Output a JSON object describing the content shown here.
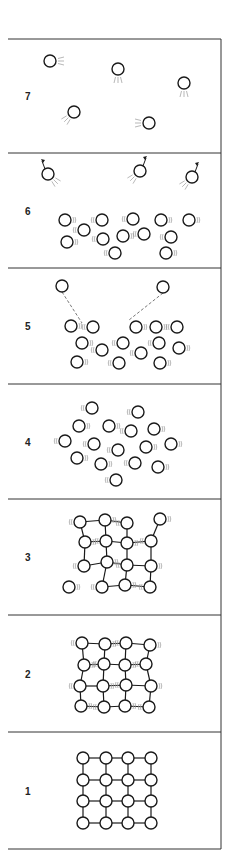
{
  "diagram": {
    "colors": {
      "line": "#1a1a1a",
      "vibration": "#9a9a9a",
      "frame": "#333333",
      "background": "#ffffff"
    },
    "panels": [
      {
        "label": "7",
        "state": "gas",
        "top": 39,
        "bottom": 153,
        "particles": [
          [
            50,
            61,
            "r"
          ],
          [
            118,
            69,
            "b"
          ],
          [
            184,
            83,
            "b"
          ],
          [
            74,
            112,
            "bl"
          ],
          [
            149,
            123,
            "l"
          ]
        ]
      },
      {
        "label": "6",
        "state": "liquid-evaporating",
        "top": 153,
        "bottom": 268,
        "escaping": [
          [
            48,
            174,
            -1
          ],
          [
            140,
            171,
            1
          ],
          [
            192,
            177,
            1
          ]
        ],
        "particles": [
          [
            65,
            220
          ],
          [
            84,
            230
          ],
          [
            102,
            220
          ],
          [
            133,
            219
          ],
          [
            161,
            220
          ],
          [
            189,
            220
          ],
          [
            67,
            242
          ],
          [
            103,
            239
          ],
          [
            123,
            236
          ],
          [
            144,
            234
          ],
          [
            171,
            237
          ],
          [
            115,
            253
          ],
          [
            166,
            253
          ]
        ]
      },
      {
        "label": "5",
        "state": "liquid",
        "top": 268,
        "bottom": 384,
        "escaping": [
          [
            62,
            286,
            82,
            323
          ],
          [
            163,
            287,
            129,
            320
          ]
        ],
        "particles": [
          [
            71,
            326
          ],
          [
            93,
            327
          ],
          [
            136,
            327
          ],
          [
            156,
            327
          ],
          [
            177,
            327
          ],
          [
            82,
            343
          ],
          [
            102,
            350
          ],
          [
            123,
            343
          ],
          [
            159,
            343
          ],
          [
            179,
            348
          ],
          [
            141,
            353
          ],
          [
            77,
            362
          ],
          [
            119,
            363
          ],
          [
            160,
            363
          ]
        ]
      },
      {
        "label": "4",
        "state": "liquid-melted",
        "top": 384,
        "bottom": 499,
        "particles": [
          [
            92,
            408
          ],
          [
            138,
            412
          ],
          [
            79,
            426
          ],
          [
            109,
            426
          ],
          [
            131,
            431
          ],
          [
            154,
            429
          ],
          [
            65,
            441
          ],
          [
            94,
            444
          ],
          [
            118,
            450
          ],
          [
            146,
            447
          ],
          [
            171,
            444
          ],
          [
            77,
            458
          ],
          [
            101,
            464
          ],
          [
            135,
            463
          ],
          [
            158,
            467
          ],
          [
            116,
            480
          ]
        ]
      },
      {
        "label": "3",
        "state": "solid-melting",
        "top": 499,
        "bottom": 615,
        "grid": [
          [
            [
              80,
              522
            ],
            [
              105,
              520
            ],
            [
              127,
              523
            ],
            [
              160,
              519
            ]
          ],
          [
            [
              85,
              542
            ],
            [
              106,
              541
            ],
            [
              127,
              543
            ],
            [
              151,
              541
            ]
          ],
          [
            [
              84,
              566
            ],
            [
              107,
              562
            ],
            [
              127,
              565
            ],
            [
              151,
              566
            ]
          ],
          [
            [
              69,
              587
            ],
            [
              102,
              587
            ],
            [
              125,
              585
            ],
            [
              150,
              587
            ]
          ]
        ]
      },
      {
        "label": "2",
        "state": "solid-vibrating",
        "top": 615,
        "bottom": 732,
        "grid": [
          [
            [
              82,
              643
            ],
            [
              105,
              644
            ],
            [
              126,
              643
            ],
            [
              150,
              645
            ]
          ],
          [
            [
              84,
              665
            ],
            [
              104,
              664
            ],
            [
              125,
              665
            ],
            [
              146,
              664
            ]
          ],
          [
            [
              80,
              686
            ],
            [
              103,
              686
            ],
            [
              126,
              685
            ],
            [
              151,
              686
            ]
          ],
          [
            [
              81,
              706
            ],
            [
              104,
              707
            ],
            [
              125,
              706
            ],
            [
              149,
              707
            ]
          ]
        ]
      },
      {
        "label": "1",
        "state": "solid",
        "top": 732,
        "bottom": 849,
        "grid": [
          [
            [
              83,
              758
            ],
            [
              106,
              758
            ],
            [
              128,
              758
            ],
            [
              151,
              758
            ]
          ],
          [
            [
              83,
              780
            ],
            [
              106,
              780
            ],
            [
              128,
              780
            ],
            [
              151,
              780
            ]
          ],
          [
            [
              83,
              801
            ],
            [
              106,
              801
            ],
            [
              128,
              801
            ],
            [
              151,
              801
            ]
          ],
          [
            [
              83,
              823
            ],
            [
              106,
              823
            ],
            [
              128,
              823
            ],
            [
              151,
              823
            ]
          ]
        ]
      }
    ]
  }
}
